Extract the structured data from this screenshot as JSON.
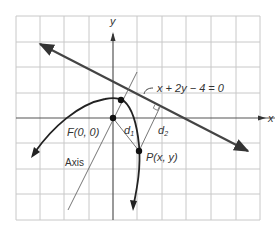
{
  "diagram": {
    "type": "parabola-focus-directrix",
    "axes": {
      "x_label": "x",
      "y_label": "y"
    },
    "directrix": {
      "equation": "x + 2y − 4 = 0"
    },
    "focus": {
      "label": "F(0, 0)"
    },
    "point": {
      "label": "P(x, y)"
    },
    "distances": {
      "d1": "d",
      "d1_sub": "1",
      "d2": "d",
      "d2_sub": "2"
    },
    "axis_label": "Axis",
    "colors": {
      "grid": "#c8c8c8",
      "curve": "#222222",
      "line": "#444444",
      "text": "#333333"
    }
  }
}
